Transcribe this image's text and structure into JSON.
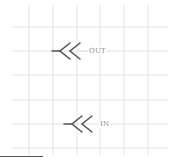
{
  "diagram": {
    "grid": {
      "color": "#d9d9d9",
      "x_lines": [
        29,
        53,
        77,
        100,
        124,
        148
      ],
      "y_lines": [
        27,
        51,
        75,
        100,
        124,
        148
      ],
      "x_extent": [
        12,
        168
      ],
      "y_extent": [
        5,
        155
      ]
    },
    "symbols": [
      {
        "id": "out",
        "label": "OUT",
        "x": 53,
        "y": 51,
        "color": "#555555"
      },
      {
        "id": "in",
        "label": "IN",
        "x": 65,
        "y": 124,
        "color": "#555555"
      }
    ],
    "bottom_bar_color": "#555555"
  }
}
